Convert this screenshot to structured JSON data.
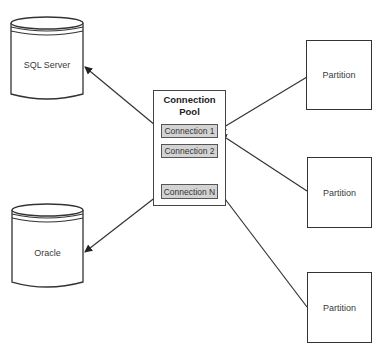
{
  "diagram": {
    "databases": [
      {
        "id": "sql",
        "label": "SQL Server"
      },
      {
        "id": "oracle",
        "label": "Oracle"
      }
    ],
    "pool": {
      "title_line1": "Connection",
      "title_line2": "Pool",
      "connections": [
        {
          "label": "Connection 1"
        },
        {
          "label": "Connection 2"
        },
        {
          "label": "Connection N"
        }
      ]
    },
    "partitions": [
      {
        "label": "Partition"
      },
      {
        "label": "Partition"
      },
      {
        "label": "Partition"
      }
    ],
    "edges": [
      {
        "from": "Connection 1",
        "to": "SQL Server"
      },
      {
        "from": "Connection N",
        "to": "Oracle"
      },
      {
        "from": "Partition 1",
        "to": "Connection 1"
      },
      {
        "from": "Partition 2",
        "to": "Connection 1"
      },
      {
        "from": "Partition 3",
        "to": "Connection N"
      }
    ],
    "colors": {
      "line": "#333333",
      "connection_fill": "#d3d3d3",
      "background": "#ffffff"
    }
  }
}
